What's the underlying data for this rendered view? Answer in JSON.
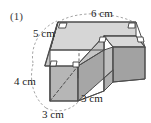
{
  "figure": {
    "number_label": "(1)",
    "shape_name": "l-shaped-stepped-solid",
    "projection": "oblique",
    "colors": {
      "top_face": "#d4d4d4",
      "front_face": "#b4b4b4",
      "side_face": "#9e9e9e",
      "inner_face": "#c2c2c2",
      "outline": "#4d4d4d",
      "hidden_edge": "#555555",
      "leader": "#9a9a9a",
      "text": "#1a1a1a",
      "background": "#ffffff"
    },
    "dimensions": [
      {
        "id": "top-depth",
        "value": "5 cm",
        "edge": "top-left-receding-edge"
      },
      {
        "id": "top-width",
        "value": "6 cm",
        "edge": "top-back-edge"
      },
      {
        "id": "front-height",
        "value": "4 cm",
        "edge": "front-left-vertical-edge"
      },
      {
        "id": "front-width",
        "value": "3 cm",
        "edge": "front-bottom-edge"
      },
      {
        "id": "side-depth",
        "value": "3 cm",
        "edge": "front-right-bottom-edge"
      }
    ],
    "right_angle_marks": 5
  }
}
